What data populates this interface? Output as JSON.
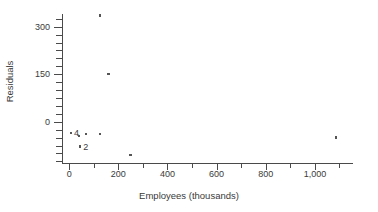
{
  "chart_data": {
    "type": "scatter",
    "title": "",
    "xlabel": "Employees (thousands)",
    "ylabel": "Residuals",
    "xlim": [
      -25,
      1155
    ],
    "ylim": [
      -130,
      340
    ],
    "grid": false,
    "legend": null,
    "x_ticks": [
      0,
      200,
      400,
      600,
      800,
      1000
    ],
    "x_tick_labels": [
      "0",
      "200",
      "400",
      "600",
      "800",
      "1,000"
    ],
    "x_minor_ticks": [
      100,
      300,
      500,
      700,
      900,
      1100
    ],
    "y_ticks": [
      0,
      150,
      300
    ],
    "y_tick_labels": [
      "0",
      "150",
      "300"
    ],
    "y_minor_ticks": [
      -125,
      -100,
      -75,
      -50,
      -25,
      25,
      50,
      75,
      100,
      125,
      175,
      200,
      225,
      250,
      275,
      325
    ],
    "points": [
      {
        "x": 125,
        "y": 335,
        "label": ""
      },
      {
        "x": 160,
        "y": 150,
        "label": ""
      },
      {
        "x": 8,
        "y": -35,
        "label": "4"
      },
      {
        "x": 40,
        "y": -45,
        "label": ""
      },
      {
        "x": 68,
        "y": -38,
        "label": ""
      },
      {
        "x": 125,
        "y": -38,
        "label": ""
      },
      {
        "x": 45,
        "y": -78,
        "label": "2"
      },
      {
        "x": 250,
        "y": -105,
        "label": ""
      },
      {
        "x": 1085,
        "y": -50,
        "label": ""
      }
    ],
    "annotations": [
      {
        "text": "4",
        "x": 8,
        "y": -35
      },
      {
        "text": "2",
        "x": 45,
        "y": -78
      }
    ],
    "marker_color": "#555555",
    "axis_color": "#4a4a4a"
  }
}
